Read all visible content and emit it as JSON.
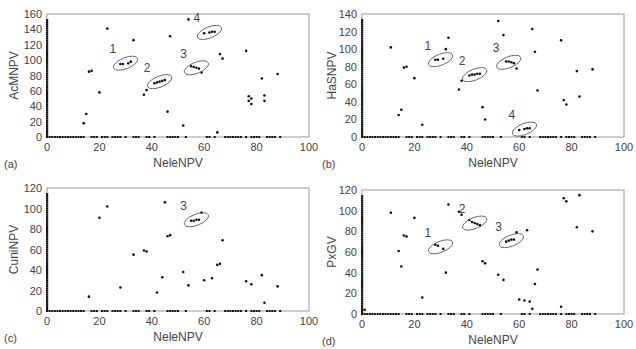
{
  "chart_data": [
    {
      "panel": "(a)",
      "type": "scatter",
      "title": "",
      "xlabel": "NeleNPV",
      "ylabel": "AcMNPV",
      "xlim": [
        0,
        100
      ],
      "ylim": [
        0,
        160
      ],
      "xticks": [
        0,
        20,
        40,
        60,
        80,
        100
      ],
      "yticks": [
        0,
        20,
        40,
        60,
        80,
        100,
        120,
        140,
        160
      ],
      "grid": false,
      "points": [
        [
          14,
          18
        ],
        [
          15,
          30
        ],
        [
          16,
          85
        ],
        [
          17,
          86
        ],
        [
          20,
          58
        ],
        [
          23,
          141
        ],
        [
          28,
          95
        ],
        [
          29,
          95
        ],
        [
          31,
          96
        ],
        [
          32,
          98
        ],
        [
          33,
          126
        ],
        [
          37,
          55
        ],
        [
          38,
          61
        ],
        [
          41,
          70
        ],
        [
          42,
          71
        ],
        [
          43,
          72
        ],
        [
          44,
          73
        ],
        [
          45,
          74
        ],
        [
          46,
          33
        ],
        [
          47,
          131
        ],
        [
          52,
          15
        ],
        [
          54,
          153
        ],
        [
          55,
          92
        ],
        [
          56,
          91
        ],
        [
          57,
          90
        ],
        [
          58,
          89
        ],
        [
          59,
          84
        ],
        [
          60,
          135
        ],
        [
          62,
          136
        ],
        [
          63,
          137
        ],
        [
          64,
          137
        ],
        [
          65,
          6
        ],
        [
          66,
          108
        ],
        [
          67,
          102
        ],
        [
          76,
          112
        ],
        [
          77,
          53
        ],
        [
          77,
          47
        ],
        [
          78,
          50
        ],
        [
          78,
          43
        ],
        [
          82,
          76
        ],
        [
          83,
          54
        ],
        [
          83,
          47
        ],
        [
          88,
          82
        ]
      ],
      "axis_points_x0": "many points along x=0 from 0 to ~155",
      "axis_points_y0": "many points along y=0 across x 0-89",
      "annotations": [
        {
          "label": "1",
          "cx": 30,
          "cy": 96
        },
        {
          "label": "2",
          "cx": 43,
          "cy": 72
        },
        {
          "label": "3",
          "cx": 57,
          "cy": 90
        },
        {
          "label": "4",
          "cx": 62,
          "cy": 136
        }
      ]
    },
    {
      "panel": "(b)",
      "type": "scatter",
      "title": "",
      "xlabel": "NeleNPV",
      "ylabel": "HaSNPV",
      "xlim": [
        0,
        100
      ],
      "ylim": [
        0,
        140
      ],
      "xticks": [
        0,
        20,
        40,
        60,
        80,
        100
      ],
      "yticks": [
        0,
        20,
        40,
        60,
        80,
        100,
        120,
        140
      ],
      "grid": false,
      "points": [
        [
          11,
          102
        ],
        [
          14,
          25
        ],
        [
          15,
          31
        ],
        [
          16,
          79
        ],
        [
          17,
          80
        ],
        [
          20,
          67
        ],
        [
          23,
          14
        ],
        [
          28,
          88
        ],
        [
          29,
          88
        ],
        [
          31,
          89
        ],
        [
          32,
          100
        ],
        [
          33,
          113
        ],
        [
          37,
          54
        ],
        [
          38,
          64
        ],
        [
          41,
          70
        ],
        [
          42,
          71
        ],
        [
          43,
          71
        ],
        [
          44,
          72
        ],
        [
          45,
          72
        ],
        [
          46,
          34
        ],
        [
          47,
          20
        ],
        [
          52,
          132
        ],
        [
          54,
          116
        ],
        [
          55,
          86
        ],
        [
          56,
          86
        ],
        [
          57,
          85
        ],
        [
          58,
          84
        ],
        [
          59,
          78
        ],
        [
          60,
          8
        ],
        [
          62,
          9
        ],
        [
          63,
          10
        ],
        [
          64,
          10
        ],
        [
          65,
          123
        ],
        [
          66,
          97
        ],
        [
          67,
          53
        ],
        [
          76,
          110
        ],
        [
          77,
          42
        ],
        [
          78,
          37
        ],
        [
          82,
          75
        ],
        [
          83,
          46
        ],
        [
          88,
          77
        ]
      ],
      "axis_points_x0": "many points along x=0 from 0 to ~135",
      "axis_points_y0": "many points along y=0 across x 0-89",
      "annotations": [
        {
          "label": "1",
          "cx": 30,
          "cy": 88
        },
        {
          "label": "2",
          "cx": 43,
          "cy": 71
        },
        {
          "label": "3",
          "cx": 56,
          "cy": 85
        },
        {
          "label": "4",
          "cx": 62,
          "cy": 9
        }
      ]
    },
    {
      "panel": "(c)",
      "type": "scatter",
      "title": "",
      "xlabel": "NeleNPV",
      "ylabel": "CuniNPV",
      "xlim": [
        0,
        100
      ],
      "ylim": [
        0,
        120
      ],
      "xticks": [
        0,
        20,
        40,
        60,
        80,
        100
      ],
      "yticks": [
        0,
        20,
        40,
        60,
        80,
        100,
        120
      ],
      "grid": false,
      "points": [
        [
          16,
          14
        ],
        [
          20,
          91
        ],
        [
          23,
          102
        ],
        [
          28,
          23
        ],
        [
          33,
          55
        ],
        [
          37,
          59
        ],
        [
          38,
          58
        ],
        [
          42,
          18
        ],
        [
          44,
          33
        ],
        [
          45,
          106
        ],
        [
          46,
          73
        ],
        [
          47,
          74
        ],
        [
          52,
          38
        ],
        [
          54,
          25
        ],
        [
          55,
          88
        ],
        [
          56,
          88
        ],
        [
          57,
          89
        ],
        [
          58,
          89
        ],
        [
          59,
          96
        ],
        [
          60,
          30
        ],
        [
          63,
          32
        ],
        [
          65,
          45
        ],
        [
          66,
          46
        ],
        [
          67,
          69
        ],
        [
          76,
          29
        ],
        [
          78,
          26
        ],
        [
          82,
          35
        ],
        [
          83,
          8
        ],
        [
          88,
          24
        ]
      ],
      "axis_points_x0": "many points along x=0 from 0 to ~110",
      "axis_points_y0": "many points along y=0 across x 0-89",
      "annotations": [
        {
          "label": "3",
          "cx": 57,
          "cy": 89
        }
      ]
    },
    {
      "panel": "(d)",
      "type": "scatter",
      "title": "",
      "xlabel": "NeleNPV",
      "ylabel": "PxGV",
      "xlim": [
        0,
        100
      ],
      "ylim": [
        0,
        120
      ],
      "xticks": [
        0,
        20,
        40,
        60,
        80,
        100
      ],
      "yticks": [
        0,
        20,
        40,
        60,
        80,
        100,
        120
      ],
      "grid": false,
      "points": [
        [
          1,
          4
        ],
        [
          11,
          98
        ],
        [
          14,
          61
        ],
        [
          15,
          46
        ],
        [
          16,
          76
        ],
        [
          17,
          75
        ],
        [
          20,
          93
        ],
        [
          23,
          16
        ],
        [
          28,
          67
        ],
        [
          29,
          66
        ],
        [
          31,
          63
        ],
        [
          32,
          40
        ],
        [
          33,
          106
        ],
        [
          37,
          99
        ],
        [
          38,
          96
        ],
        [
          41,
          91
        ],
        [
          42,
          89
        ],
        [
          43,
          88
        ],
        [
          44,
          87
        ],
        [
          45,
          86
        ],
        [
          46,
          51
        ],
        [
          47,
          49
        ],
        [
          52,
          38
        ],
        [
          54,
          33
        ],
        [
          55,
          70
        ],
        [
          56,
          71
        ],
        [
          57,
          72
        ],
        [
          58,
          72
        ],
        [
          59,
          79
        ],
        [
          60,
          14
        ],
        [
          62,
          13
        ],
        [
          63,
          81
        ],
        [
          64,
          12
        ],
        [
          65,
          5
        ],
        [
          66,
          29
        ],
        [
          67,
          43
        ],
        [
          76,
          7
        ],
        [
          77,
          112
        ],
        [
          78,
          109
        ],
        [
          82,
          84
        ],
        [
          83,
          115
        ],
        [
          88,
          80
        ]
      ],
      "axis_points_x0": "many points along x=0 from 0 to ~120",
      "axis_points_y0": "many points along y=0 across x 0-89",
      "annotations": [
        {
          "label": "1",
          "cx": 30,
          "cy": 65
        },
        {
          "label": "2",
          "cx": 43,
          "cy": 88
        },
        {
          "label": "3",
          "cx": 57,
          "cy": 71
        }
      ]
    }
  ],
  "panels": [
    {
      "label": "(a)",
      "xlabel": "NeleNPV",
      "ylabel": "AcMNPV"
    },
    {
      "label": "(b)",
      "xlabel": "NeleNPV",
      "ylabel": "HaSNPV"
    },
    {
      "label": "(c)",
      "xlabel": "NeleNPV",
      "ylabel": "CuniNPV"
    },
    {
      "label": "(d)",
      "xlabel": "NeleNPV",
      "ylabel": "PxGV"
    }
  ],
  "style": {
    "axis_color": "#9a9a9a",
    "point_color": "#111111",
    "text_color": "#444444"
  }
}
